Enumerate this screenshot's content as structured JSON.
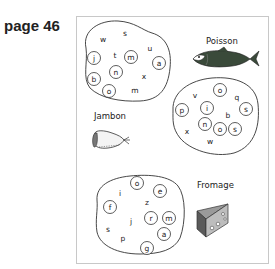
{
  "page": {
    "label": "page 46"
  },
  "groups": [
    {
      "id": "top-left",
      "free_letters": [
        {
          "ch": "w",
          "x": 103,
          "y": 39
        },
        {
          "ch": "s",
          "x": 125,
          "y": 33
        },
        {
          "ch": "t",
          "x": 115,
          "y": 55
        },
        {
          "ch": "u",
          "x": 150,
          "y": 48
        },
        {
          "ch": "x",
          "x": 144,
          "y": 76
        },
        {
          "ch": "m",
          "x": 135,
          "y": 90
        }
      ],
      "circled_letters": [
        {
          "ch": "j",
          "x": 94,
          "y": 58
        },
        {
          "ch": "m",
          "x": 131,
          "y": 57
        },
        {
          "ch": "a",
          "x": 159,
          "y": 63
        },
        {
          "ch": "n",
          "x": 116,
          "y": 72
        },
        {
          "ch": "b",
          "x": 94,
          "y": 79
        },
        {
          "ch": "o",
          "x": 109,
          "y": 91
        }
      ]
    },
    {
      "id": "right",
      "free_letters": [
        {
          "ch": "v",
          "x": 195,
          "y": 95
        },
        {
          "ch": "q",
          "x": 237,
          "y": 97
        },
        {
          "ch": "b",
          "x": 228,
          "y": 115
        },
        {
          "ch": "x",
          "x": 187,
          "y": 131
        },
        {
          "ch": "w",
          "x": 210,
          "y": 141
        }
      ],
      "circled_letters": [
        {
          "ch": "o",
          "x": 220,
          "y": 90
        },
        {
          "ch": "p",
          "x": 182,
          "y": 110
        },
        {
          "ch": "i",
          "x": 207,
          "y": 108
        },
        {
          "ch": "s",
          "x": 246,
          "y": 109
        },
        {
          "ch": "n",
          "x": 205,
          "y": 124
        },
        {
          "ch": "o",
          "x": 220,
          "y": 129
        },
        {
          "ch": "s",
          "x": 235,
          "y": 129
        }
      ]
    },
    {
      "id": "bottom",
      "free_letters": [
        {
          "ch": "i",
          "x": 120,
          "y": 193
        },
        {
          "ch": "z",
          "x": 147,
          "y": 202
        },
        {
          "ch": "j",
          "x": 131,
          "y": 221
        },
        {
          "ch": "s",
          "x": 108,
          "y": 229
        },
        {
          "ch": "p",
          "x": 123,
          "y": 238
        }
      ],
      "circled_letters": [
        {
          "ch": "o",
          "x": 137,
          "y": 183
        },
        {
          "ch": "e",
          "x": 160,
          "y": 191
        },
        {
          "ch": "f",
          "x": 110,
          "y": 207
        },
        {
          "ch": "r",
          "x": 151,
          "y": 218
        },
        {
          "ch": "m",
          "x": 169,
          "y": 218
        },
        {
          "ch": "a",
          "x": 164,
          "y": 234
        },
        {
          "ch": "g",
          "x": 147,
          "y": 248
        }
      ]
    }
  ],
  "items": [
    {
      "id": "poisson",
      "label": "Poisson",
      "label_x": 206,
      "label_y": 44
    },
    {
      "id": "jambon",
      "label": "Jambon",
      "label_x": 94,
      "label_y": 119
    },
    {
      "id": "fromage",
      "label": "Fromage",
      "label_x": 197,
      "label_y": 188
    }
  ],
  "icons": [
    "fish-icon",
    "ham-icon",
    "cheese-icon"
  ],
  "colors": {
    "ink": "#222222",
    "border": "#c8c8c8",
    "fish_body": "#3a4a3a",
    "cheese_top": "#8a8a8a",
    "cheese_side": "#5a5a5a"
  }
}
